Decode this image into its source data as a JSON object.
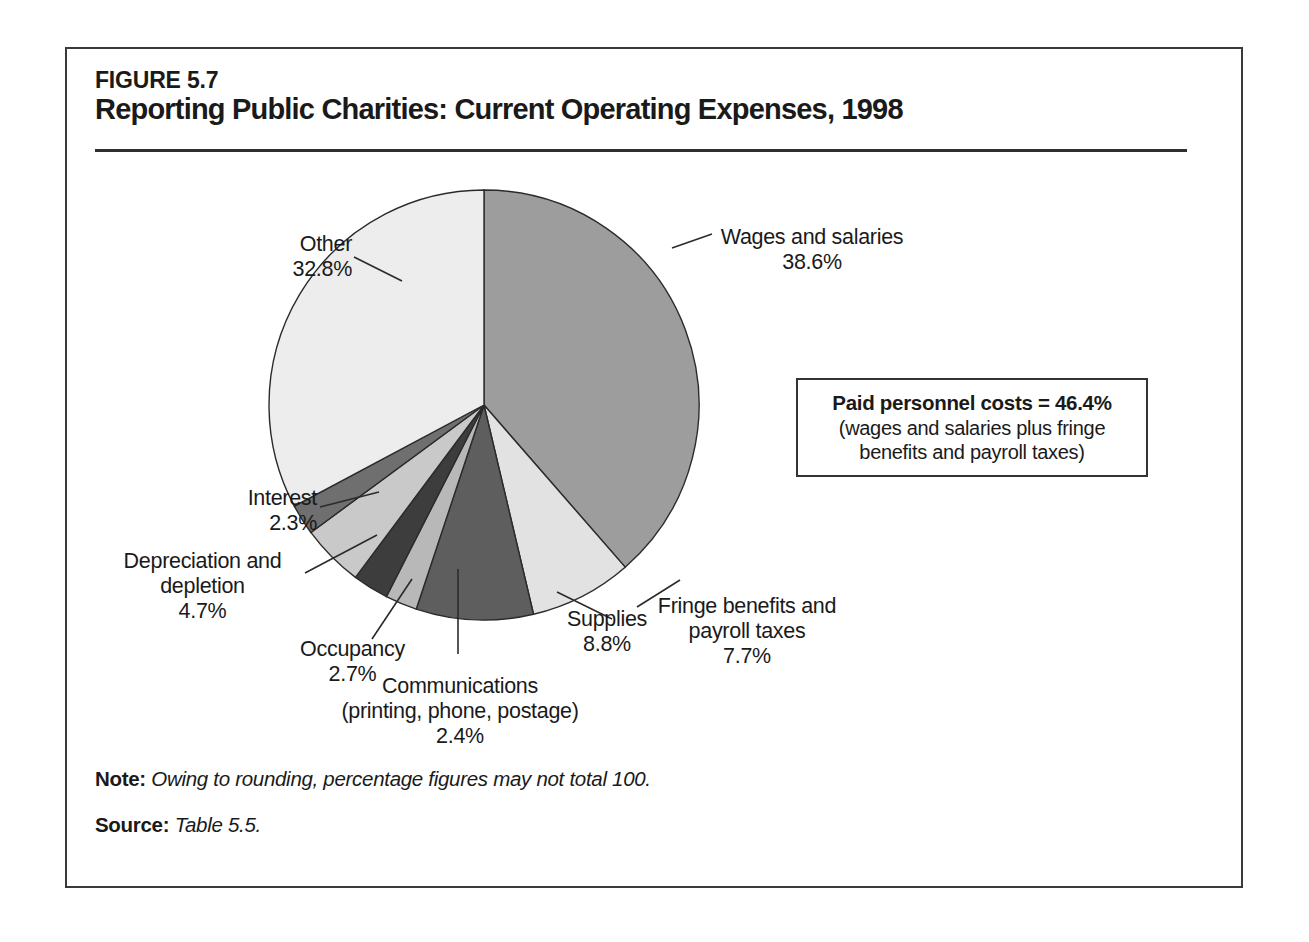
{
  "figure": {
    "number": "FIGURE 5.7",
    "title": "Reporting Public Charities: Current Operating Expenses, 1998"
  },
  "callout": {
    "headline": "Paid personnel costs = 46.4%",
    "sub_line1": "(wages and salaries plus fringe",
    "sub_line2": "benefits and payroll taxes)"
  },
  "footer": {
    "note_label": "Note:",
    "note_text": "Owing to rounding, percentage figures may not total 100.",
    "source_label": "Source:",
    "source_text": "Table 5.5."
  },
  "labels": {
    "other": {
      "name": "Other",
      "value": "32.8%"
    },
    "wages": {
      "name": "Wages and salaries",
      "value": "38.6%"
    },
    "interest": {
      "name": "Interest",
      "value": "2.3%"
    },
    "depreciation": {
      "line1": "Depreciation and",
      "line2": "depletion",
      "value": "4.7%"
    },
    "occupancy": {
      "name": "Occupancy",
      "value": "2.7%"
    },
    "communications": {
      "line1": "Communications",
      "line2": "(printing, phone, postage)",
      "value": "2.4%"
    },
    "supplies": {
      "name": "Supplies",
      "value": "8.8%"
    },
    "fringe": {
      "line1": "Fringe benefits and",
      "line2": "payroll taxes",
      "value": "7.7%"
    }
  },
  "chart_data": {
    "type": "pie",
    "title": "Reporting Public Charities: Current Operating Expenses, 1998",
    "unit": "percent",
    "start_angle_deg": 0,
    "direction": "clockwise",
    "total_label": "100",
    "legend": "none (direct labels with leader lines)",
    "categories": [
      "Wages and salaries",
      "Fringe benefits and payroll taxes",
      "Supplies",
      "Communications (printing, phone, postage)",
      "Occupancy",
      "Depreciation and depletion",
      "Interest",
      "Other"
    ],
    "values": [
      38.6,
      7.7,
      8.8,
      2.4,
      2.7,
      4.7,
      2.3,
      32.8
    ],
    "colors": [
      "#9d9d9d",
      "#e2e2e2",
      "#5e5e5e",
      "#b8b8b8",
      "#3d3d3d",
      "#c9c9c9",
      "#6f6f6f",
      "#ededed"
    ],
    "annotations": [
      "Paid personnel costs = 46.4% (wages and salaries plus fringe benefits and payroll taxes)"
    ],
    "note": "Owing to rounding, percentage figures may not total 100.",
    "source": "Table 5.5."
  },
  "geometry": {
    "cx": 417,
    "cy": 356,
    "r": 215
  }
}
